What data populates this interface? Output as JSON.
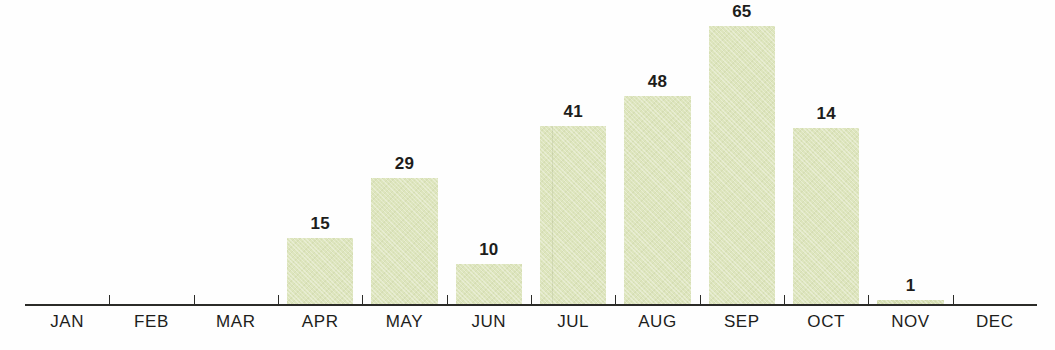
{
  "chart_data": {
    "type": "bar",
    "title": "",
    "subtitle": "",
    "xlabel": "",
    "ylabel": "",
    "grid": false,
    "legend": false,
    "axis": {
      "x_axis_visible": true,
      "y_axis_visible": false,
      "ticks": "between-categories"
    },
    "categories": [
      "JAN",
      "FEB",
      "MAR",
      "APR",
      "MAY",
      "JUN",
      "JUL",
      "AUG",
      "SEP",
      "OCT",
      "NOV",
      "DEC"
    ],
    "values": [
      0,
      0,
      0,
      15,
      29,
      10,
      41,
      48,
      65,
      14,
      1,
      0
    ],
    "data_labels": [
      "",
      "",
      "",
      "15",
      "29",
      "10",
      "41",
      "48",
      "65",
      "14",
      "1",
      ""
    ],
    "ylim": [
      0,
      65
    ],
    "bar_color": "#dde5bd",
    "label_color": "#1d1d1b",
    "axis_color": "#2b2b28",
    "background_color": "#ffffff",
    "bars": [
      {
        "category": "JAN",
        "value": 0,
        "label": "",
        "px_height": 0,
        "show_bar": false,
        "show_label": false
      },
      {
        "category": "FEB",
        "value": 0,
        "label": "",
        "px_height": 0,
        "show_bar": false,
        "show_label": false
      },
      {
        "category": "MAR",
        "value": 0,
        "label": "",
        "px_height": 0,
        "show_bar": false,
        "show_label": false
      },
      {
        "category": "APR",
        "value": 15,
        "label": "15",
        "px_height": 67,
        "show_bar": true,
        "show_label": true
      },
      {
        "category": "MAY",
        "value": 29,
        "label": "29",
        "px_height": 127,
        "show_bar": true,
        "show_label": true
      },
      {
        "category": "JUN",
        "value": 10,
        "label": "10",
        "px_height": 41,
        "show_bar": true,
        "show_label": true
      },
      {
        "category": "JUL",
        "value": 41,
        "label": "41",
        "px_height": 179,
        "show_bar": true,
        "show_label": true
      },
      {
        "category": "AUG",
        "value": 48,
        "label": "48",
        "px_height": 209,
        "show_bar": true,
        "show_label": true
      },
      {
        "category": "SEP",
        "value": 65,
        "label": "65",
        "px_height": 279,
        "show_bar": true,
        "show_label": true
      },
      {
        "category": "OCT",
        "value": 14,
        "label": "14",
        "px_height": 177,
        "show_bar": true,
        "show_label": true
      },
      {
        "category": "NOV",
        "value": 1,
        "label": "1",
        "px_height": 5,
        "show_bar": true,
        "show_label": true
      },
      {
        "category": "DEC",
        "value": 0,
        "label": "",
        "px_height": 0,
        "show_bar": false,
        "show_label": false
      }
    ]
  }
}
